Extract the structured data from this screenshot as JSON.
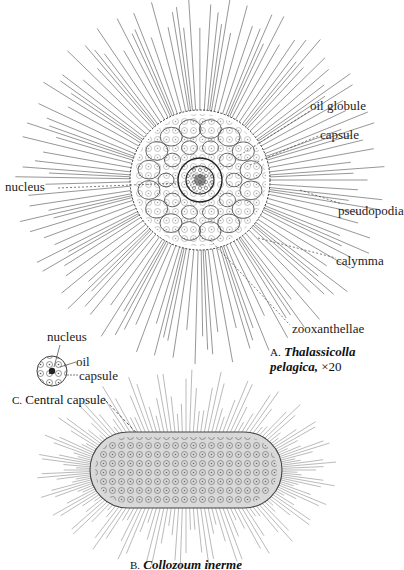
{
  "figure": {
    "colors": {
      "ink": "#1a1a1a",
      "background": "#ffffff",
      "body_shade": "#8c8c8c"
    },
    "figure_a": {
      "letter": "A.",
      "genus": "Thalassicolla",
      "species": "pelagica,",
      "magnification": "×20",
      "labels": {
        "oil_globule": "oil globule",
        "capsule": "capsule",
        "nucleus": "nucleus",
        "pseudopodia": "pseudopodia",
        "calymma": "calymma",
        "zooxanthellae": "zooxanthellae"
      }
    },
    "figure_b": {
      "letter": "B.",
      "name": "Collozoum inerme"
    },
    "figure_c": {
      "letter": "C.",
      "name": "Central capsule",
      "labels": {
        "nucleus": "nucleus",
        "oil": "oil",
        "capsule": "capsule"
      }
    }
  }
}
